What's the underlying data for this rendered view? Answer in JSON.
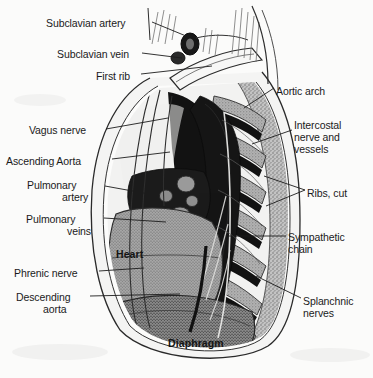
{
  "figure": {
    "background_color": "#fbfbfa",
    "ink_color": "#1a1a1a"
  },
  "labels_left": [
    {
      "text": "Subclavian artery",
      "x": 46,
      "y": 17
    },
    {
      "text": "Subclavian vein",
      "x": 57,
      "y": 48
    },
    {
      "text": "First rib",
      "x": 96,
      "y": 70
    },
    {
      "text": "Vagus nerve",
      "x": 29,
      "y": 124
    },
    {
      "text": "Ascending Aorta",
      "x": 6,
      "y": 155
    },
    {
      "text": "Pulmonary",
      "x": 27,
      "y": 179
    },
    {
      "text": "artery",
      "x": 62,
      "y": 191
    },
    {
      "text": "Pulmonary",
      "x": 26,
      "y": 213
    },
    {
      "text": "veins",
      "x": 67,
      "y": 225
    },
    {
      "text": "Phrenic nerve",
      "x": 14,
      "y": 267
    },
    {
      "text": "Descending",
      "x": 16,
      "y": 291
    },
    {
      "text": "aorta",
      "x": 43,
      "y": 303
    }
  ],
  "labels_right": [
    {
      "text": "Aortic arch",
      "x": 276,
      "y": 85
    },
    {
      "text": "Intercostal",
      "x": 294,
      "y": 119
    },
    {
      "text": "nerve and",
      "x": 294,
      "y": 131
    },
    {
      "text": "vessels",
      "x": 294,
      "y": 143
    },
    {
      "text": "Ribs, cut",
      "x": 307,
      "y": 187
    },
    {
      "text": "Sympathetic",
      "x": 288,
      "y": 231
    },
    {
      "text": "chain",
      "x": 288,
      "y": 243
    },
    {
      "text": "Splanchnic",
      "x": 303,
      "y": 295
    },
    {
      "text": "nerves",
      "x": 303,
      "y": 307
    }
  ],
  "labels_internal": [
    {
      "text": "Heart",
      "x": 116,
      "y": 248
    },
    {
      "text": "Diaphragm",
      "x": 168,
      "y": 337
    }
  ],
  "colors": {
    "bone_stipple": "#b9b9b9",
    "muscle_grey": "#a8a8a8",
    "dark_vessel": "#171717",
    "outline": "#222222",
    "pale": "#efefee"
  }
}
